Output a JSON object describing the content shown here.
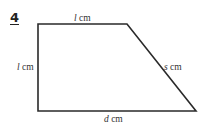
{
  "question_number": "4",
  "shape": "trapezium",
  "labels": {
    "top": {
      "var": "l",
      "unit": " cm"
    },
    "left": {
      "var": "l",
      "unit": " cm"
    },
    "slant": {
      "var": "s",
      "unit": " cm"
    },
    "bottom": {
      "var": "d",
      "unit": " cm"
    }
  },
  "colors": {
    "stroke": "#2a2a2a",
    "text": "#333333"
  }
}
